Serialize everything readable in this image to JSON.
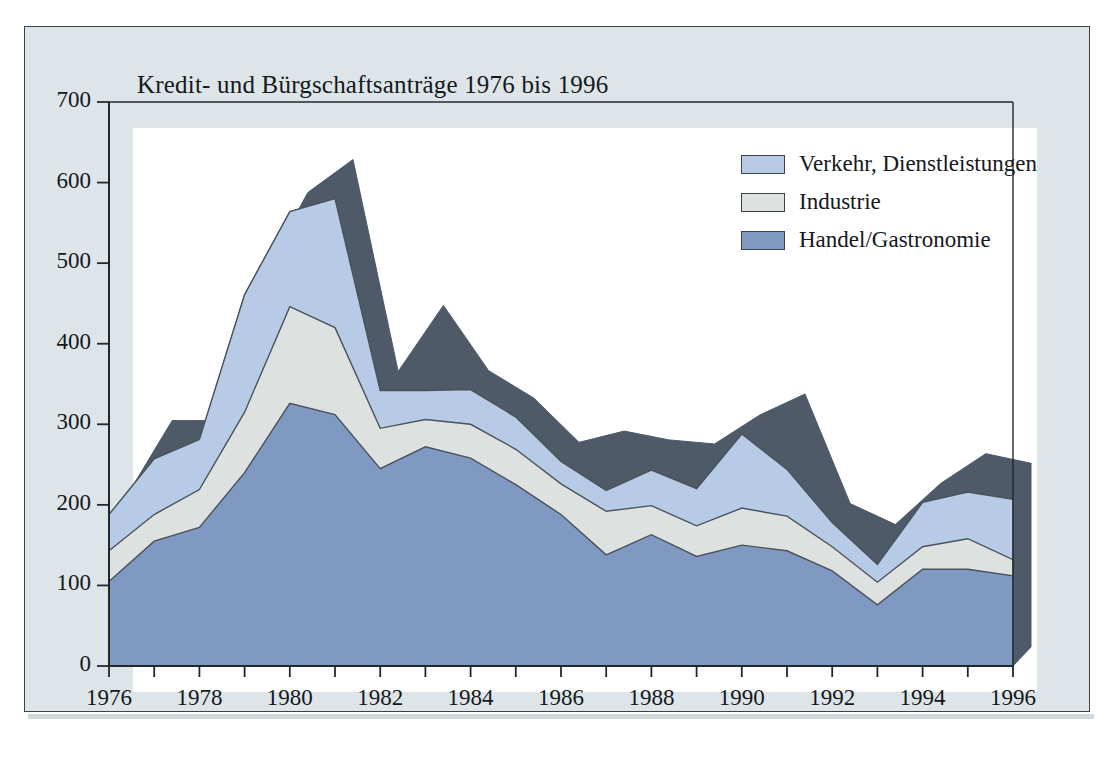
{
  "chart_data": {
    "type": "area",
    "stacked": true,
    "title": "Kredit- und Bürgschaftsanträge 1976 bis 1996",
    "xlabel": "",
    "ylabel": "",
    "ylim": [
      0,
      700
    ],
    "ytick_values": [
      0,
      100,
      200,
      300,
      400,
      500,
      600,
      700
    ],
    "ytick_labels": [
      "0",
      "100",
      "200",
      "300",
      "400",
      "500",
      "600",
      "700"
    ],
    "xtick_labels": [
      "1976",
      "1978",
      "1980",
      "1982",
      "1984",
      "1986",
      "1988",
      "1990",
      "1992",
      "1994",
      "1996"
    ],
    "grid": false,
    "legend_position": "top-right",
    "x": [
      1976,
      1977,
      1978,
      1979,
      1980,
      1981,
      1982,
      1983,
      1984,
      1985,
      1986,
      1987,
      1988,
      1989,
      1990,
      1991,
      1992,
      1993,
      1994,
      1995,
      1996
    ],
    "categories": [
      "1976",
      "1977",
      "1978",
      "1979",
      "1980",
      "1981",
      "1982",
      "1983",
      "1984",
      "1985",
      "1986",
      "1987",
      "1988",
      "1989",
      "1990",
      "1991",
      "1992",
      "1993",
      "1994",
      "1995",
      "1996"
    ],
    "series": [
      {
        "name": "Handel/Gastronomie",
        "color": "#8099c2",
        "values": [
          105,
          155,
          172,
          240,
          326,
          312,
          245,
          272,
          258,
          225,
          188,
          138,
          163,
          136,
          150,
          143,
          118,
          76,
          120,
          120,
          112
        ]
      },
      {
        "name": "Industrie",
        "color": "#dde2e0",
        "values": [
          38,
          33,
          47,
          75,
          120,
          108,
          50,
          34,
          42,
          44,
          38,
          54,
          36,
          38,
          46,
          43,
          30,
          28,
          28,
          38,
          20
        ]
      },
      {
        "name": "Verkehr, Dienstleistungen",
        "color": "#b8cbe6",
        "values": [
          45,
          69,
          62,
          146,
          118,
          160,
          47,
          36,
          43,
          40,
          28,
          26,
          44,
          46,
          92,
          58,
          30,
          22,
          55,
          58,
          75
        ]
      }
    ],
    "series_totals": [
      188,
      257,
      281,
      461,
      564,
      580,
      342,
      342,
      343,
      309,
      254,
      218,
      243,
      220,
      288,
      244,
      178,
      126,
      203,
      216,
      207
    ],
    "shadow_totals": [
      188,
      281,
      281,
      461,
      564,
      605,
      342,
      424,
      343,
      309,
      254,
      268,
      257,
      252,
      288,
      314,
      178,
      152,
      203,
      240,
      228
    ],
    "annotations": []
  },
  "legend": {
    "items": [
      {
        "label": "Verkehr, Dienstleistungen",
        "color": "#b8cbe6"
      },
      {
        "label": "Industrie",
        "color": "#dde2e0"
      },
      {
        "label": "Handel/Gastronomie",
        "color": "#8099c2"
      }
    ]
  },
  "colors": {
    "panel_background": "#dde5e8",
    "plot_background": "#ffffff",
    "axis": "#22272c",
    "shadow_3d": "#4e5a68",
    "outline": "#3b4248",
    "text": "#15181c"
  }
}
